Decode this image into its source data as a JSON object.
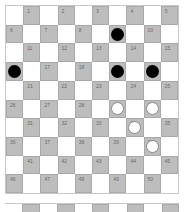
{
  "game": "International draughts (10x10)",
  "board": {
    "size": 10,
    "colors": {
      "light": "#ffffff",
      "dark": "#bdbdbd",
      "black_piece": "#000000",
      "white_piece": "#ffffff"
    },
    "squares": [
      1,
      2,
      3,
      4,
      5,
      6,
      7,
      8,
      9,
      10,
      11,
      12,
      13,
      14,
      15,
      16,
      17,
      18,
      19,
      20,
      21,
      22,
      23,
      24,
      25,
      26,
      27,
      28,
      29,
      30,
      31,
      32,
      33,
      34,
      35,
      36,
      37,
      38,
      39,
      40,
      41,
      42,
      43,
      44,
      45,
      46,
      47,
      48,
      49,
      50
    ],
    "pieces": {
      "9": "black",
      "16": "black",
      "19": "black",
      "20": "black",
      "29": "white",
      "30": "white",
      "34": "white",
      "40": "white"
    }
  }
}
